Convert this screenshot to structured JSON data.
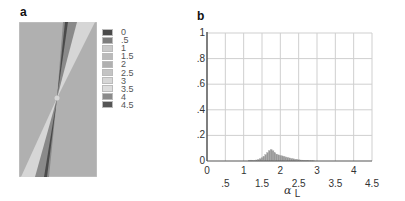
{
  "chart_data": [
    {
      "type": "heatmap",
      "panel": "a",
      "title": "",
      "description": "Grayscale field map: two narrow wedge-shaped bands crossing through a central point, upper-right and lower-left, on a uniform background",
      "legend": {
        "placement": "right",
        "entries": [
          {
            "label": "0",
            "color": "#4a4a4a"
          },
          {
            "label": ".5",
            "color": "#7d7d7d"
          },
          {
            "label": "1",
            "color": "#c9c9c9"
          },
          {
            "label": "1.5",
            "color": "#bababa"
          },
          {
            "label": "2",
            "color": "#b0b0b0"
          },
          {
            "label": "2.5",
            "color": "#c4c4c4"
          },
          {
            "label": "3",
            "color": "#d6d6d6"
          },
          {
            "label": "3.5",
            "color": "#dcdcdc"
          },
          {
            "label": "4",
            "color": "#8a8a8a"
          },
          {
            "label": "4.5",
            "color": "#555555"
          }
        ]
      },
      "background_value": 2,
      "bands": [
        {
          "direction": "upper",
          "values": [
            0,
            4,
            3
          ]
        },
        {
          "direction": "lower",
          "values": [
            0,
            4,
            3
          ]
        }
      ]
    },
    {
      "type": "bar",
      "panel": "b",
      "title": "",
      "xlabel": "α",
      "xlabel_sub": "L",
      "ylabel": "",
      "xlim": [
        0,
        4.5
      ],
      "ylim": [
        0,
        1
      ],
      "grid": true,
      "x_ticks_row1": [
        "0",
        "1",
        "2",
        "3",
        "4"
      ],
      "x_ticks_row2": [
        ".5",
        "1.5",
        "2.5",
        "3.5",
        "4.5"
      ],
      "x_tick_values_row1": [
        0,
        1,
        2,
        3,
        4
      ],
      "x_tick_values_row2": [
        0.5,
        1.5,
        2.5,
        3.5,
        4.5
      ],
      "y_ticks": [
        "0",
        ".2",
        ".4",
        ".6",
        ".8",
        "1"
      ],
      "y_tick_values": [
        0,
        0.2,
        0.4,
        0.6,
        0.8,
        1
      ],
      "bin_width": 0.05,
      "x": [
        1.15,
        1.2,
        1.25,
        1.3,
        1.35,
        1.4,
        1.45,
        1.5,
        1.55,
        1.6,
        1.65,
        1.7,
        1.75,
        1.8,
        1.85,
        1.9,
        1.95,
        2.0,
        2.05,
        2.1,
        2.15,
        2.2,
        2.25,
        2.3,
        2.35,
        2.4,
        2.45,
        2.5,
        2.55,
        2.6,
        2.65,
        2.7,
        2.75,
        2.8,
        2.85,
        2.9
      ],
      "values": [
        0.005,
        0.007,
        0.004,
        0.006,
        0.008,
        0.012,
        0.018,
        0.026,
        0.036,
        0.05,
        0.066,
        0.082,
        0.09,
        0.08,
        0.064,
        0.054,
        0.048,
        0.044,
        0.04,
        0.036,
        0.032,
        0.028,
        0.024,
        0.02,
        0.017,
        0.014,
        0.012,
        0.01,
        0.008,
        0.007,
        0.006,
        0.005,
        0.004,
        0.003,
        0.003,
        0.002
      ],
      "bar_color": "#999999"
    }
  ],
  "labels": {
    "panel_a": "a",
    "panel_b": "b"
  }
}
